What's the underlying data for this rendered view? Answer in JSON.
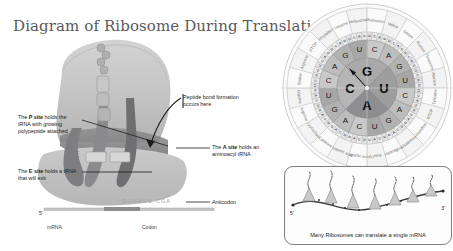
{
  "document": {
    "title": "Diagram of Ribosome During Translation",
    "background_color": "#ffffff",
    "title_color": "#5a5a5c"
  },
  "ribosome_panel": {
    "name": "ribosome-translation-diagram",
    "site_letters": [
      "E",
      "P",
      "A"
    ],
    "callouts": [
      {
        "id": "p-site",
        "lead": "The ",
        "bold": "P site",
        "text": " holds the tRNA with growing polypeptide attached"
      },
      {
        "id": "e-site",
        "lead": "The ",
        "bold": "E site",
        "text": " holds a tRNA that will exit"
      },
      {
        "id": "peptide-bond",
        "lead": "",
        "bold": "",
        "text": "Peptide bond formation occurs here"
      },
      {
        "id": "a-site",
        "lead": "The ",
        "bold": "A site",
        "text": " holds an aminoacyl tRNA"
      },
      {
        "id": "anticodon",
        "lead": "",
        "bold": "",
        "text": "Anticodon"
      }
    ],
    "p_site_lead": "The ",
    "p_site_bold": "P site",
    "p_site_rest": " holds the tRNA with growing polypeptide attached",
    "e_site_lead": "The ",
    "e_site_bold": "E site",
    "e_site_rest": " holds a tRNA that will exit",
    "a_site_lead": "The ",
    "a_site_bold": "A site",
    "a_site_rest": " holds an aminoacyl tRNA",
    "peptide_bond_label": "Peptide bond formation occurs here",
    "anticodon_label": "Anticodon",
    "mrna_label": "mRNA",
    "codon_label": "Codon",
    "five_prime_label": "5'",
    "anticodon_sequence": "GUGAGUCGA",
    "mrna_sequence": "AUAUUUCGGGAAACACUCAGCUUGGAGUAUAU"
  },
  "codon_wheel": {
    "name": "codon-wheel",
    "ring1": [
      "G",
      "U",
      "A",
      "C"
    ],
    "ring2": [
      "C",
      "A",
      "G",
      "U",
      "C",
      "A",
      "G",
      "U",
      "C",
      "A",
      "G",
      "U",
      "C",
      "A",
      "G",
      "U"
    ],
    "ring3": [
      "U",
      "C",
      "A",
      "G",
      "U",
      "C",
      "A",
      "G",
      "U",
      "C",
      "A",
      "G",
      "U",
      "C",
      "A",
      "G",
      "U",
      "C",
      "A",
      "G",
      "U",
      "C",
      "A",
      "G",
      "U",
      "C",
      "A",
      "G",
      "U",
      "C",
      "A",
      "G",
      "U",
      "C",
      "A",
      "G",
      "U",
      "C",
      "A",
      "G",
      "U",
      "C",
      "A",
      "G",
      "U",
      "C",
      "A",
      "G",
      "U",
      "C",
      "A",
      "G",
      "U",
      "C",
      "A",
      "G",
      "U",
      "C",
      "A",
      "G",
      "U",
      "C",
      "A",
      "G"
    ],
    "amino_acids": [
      "Phenylalanine",
      "Leucine",
      "Isoleucine",
      "Methionine",
      "Valine",
      "Serine",
      "Proline",
      "Threonine",
      "Alanine",
      "Tyrosine",
      "STOP",
      "Histidine",
      "Glutamine",
      "Asparagine",
      "Lysine",
      "Aspartic acid",
      "Glutamic acid",
      "Cysteine",
      "Tryptophan",
      "Arginine",
      "Glycine",
      "Serine",
      "Arginine",
      "STOP"
    ]
  },
  "polysome_inset": {
    "name": "polysome-inset",
    "caption": "Many Ribosomes can translate a single mRNA",
    "five_prime": "5'",
    "three_prime": "3'",
    "ribosome_count": 7
  }
}
